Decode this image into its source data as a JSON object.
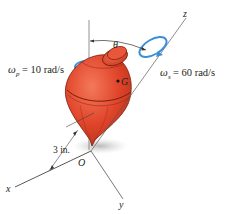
{
  "diagram": {
    "precession_label": "ω",
    "precession_sub": "p",
    "precession_value": "= 10 rad/s",
    "spin_label": "ω",
    "spin_sub": "s",
    "spin_value": "= 60 rad/s",
    "angle_label": "θ",
    "center_of_mass_label": "G",
    "origin_label": "O",
    "distance_label": "3 in.",
    "axes": {
      "x": "x",
      "y": "y",
      "z": "z"
    },
    "colors": {
      "top_body": "#e0452a",
      "top_shadow": "#b52e18",
      "rotation_arrow": "#3b8fd8",
      "axis_line": "#555555"
    }
  }
}
